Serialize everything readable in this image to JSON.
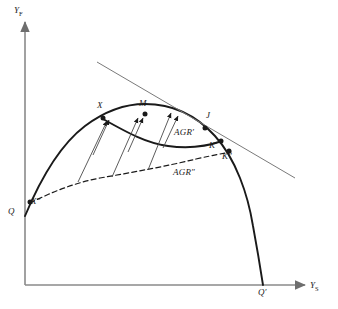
{
  "figure": {
    "type": "economics-ppf-diagram",
    "background": "#ffffff",
    "ink": "#1a1a1a",
    "axis_color": "#8a8a8a"
  },
  "axes": {
    "y_axis": {
      "name": "Y",
      "subscript": "F",
      "label": "YF"
    },
    "x_axis": {
      "name": "Y",
      "subscript": "S",
      "label": "YS"
    }
  },
  "points": [
    {
      "id": "Q",
      "label": "Q",
      "x": 26,
      "y": 210
    },
    {
      "id": "Xdp",
      "label": "X″",
      "x": 33,
      "y": 196
    },
    {
      "id": "X",
      "label": "X",
      "x": 102,
      "y": 113
    },
    {
      "id": "M",
      "label": "M",
      "x": 143,
      "y": 110
    },
    {
      "id": "J",
      "label": "J",
      "x": 203,
      "y": 117
    },
    {
      "id": "Kp",
      "label": "K′",
      "x": 219,
      "y": 138
    },
    {
      "id": "Kdp",
      "label": "K″",
      "x": 228,
      "y": 148
    },
    {
      "id": "Qp",
      "label": "Q′",
      "x": 262,
      "y": 282
    }
  ],
  "curves": [
    {
      "id": "ppf",
      "label": "",
      "style": "solid-thick",
      "desc": "production possibility frontier Q to Q-prime"
    },
    {
      "id": "agr1",
      "label": "AGR′",
      "style": "solid-thick",
      "desc": "inner frontier from X to K-prime",
      "label_x": 175,
      "label_y": 129
    },
    {
      "id": "agr2",
      "label": "AGR″",
      "style": "dashed",
      "desc": "dashed frontier from X-double-prime to K-double-prime",
      "label_x": 175,
      "label_y": 173
    },
    {
      "id": "tangent",
      "label": "",
      "style": "solid-thin",
      "desc": "price line tangent near J"
    }
  ],
  "arrows": {
    "count": 6,
    "desc": "transfer arrows from the dashed AGR-double-prime locus up toward the AGR-prime locus"
  },
  "labels": {
    "y_axis": "YF",
    "x_axis": "YS",
    "Q": "Q",
    "Q_prime": "Q′",
    "X": "X",
    "X_double_prime": "X″",
    "M": "M",
    "J": "J",
    "K_prime": "K′",
    "K_double_prime": "K″",
    "AGR_prime": "AGR′",
    "AGR_double_prime": "AGR″"
  }
}
